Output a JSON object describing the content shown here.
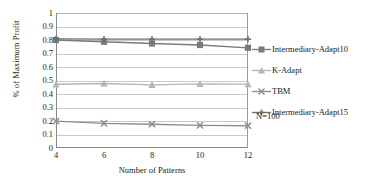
{
  "chart_data": {
    "type": "line",
    "title": "",
    "xlabel": "Number of Patterns",
    "ylabel": "% of Maximum Profit",
    "categories": [
      4,
      6,
      8,
      10,
      12
    ],
    "x_tick_labels": [
      "4",
      "6",
      "8",
      "10",
      "12"
    ],
    "y_tick_labels": [
      "0",
      "0.1",
      "0.2",
      "0.3",
      "0.4",
      "0.5",
      "0.6",
      "0.7",
      "0.8",
      "0.9",
      "1"
    ],
    "ylim": [
      0,
      1
    ],
    "y_tick_step": 0.1,
    "grid": "horizontal",
    "legend_position": "right",
    "annotation": "N=100",
    "series": [
      {
        "name": "Intermediary-Adapt10",
        "marker": "square",
        "color": "#7a7a7a",
        "values": [
          0.8,
          0.787,
          0.774,
          0.763,
          0.742
        ]
      },
      {
        "name": "K-Adapt",
        "marker": "triangle",
        "color": "#b5b5b5",
        "values": [
          0.472,
          0.478,
          0.468,
          0.475,
          0.473
        ]
      },
      {
        "name": "TBM",
        "marker": "x",
        "color": "#8e8e8e",
        "values": [
          0.199,
          0.182,
          0.176,
          0.168,
          0.165
        ]
      },
      {
        "name": "Intermediary-Adapt15",
        "marker": "plus",
        "color": "#6e6e6e",
        "values": [
          0.808,
          0.806,
          0.806,
          0.806,
          0.806
        ]
      }
    ]
  },
  "legend": {
    "items": [
      {
        "label": "Intermediary-Adapt10"
      },
      {
        "label": "K-Adapt"
      },
      {
        "label": "TBM"
      },
      {
        "label": "Intermediary-Adapt15"
      }
    ]
  },
  "axes": {
    "x_title": "Number of Patterns",
    "y_title": "% of Maximum Profit"
  },
  "annotation": {
    "text": "N=100"
  }
}
